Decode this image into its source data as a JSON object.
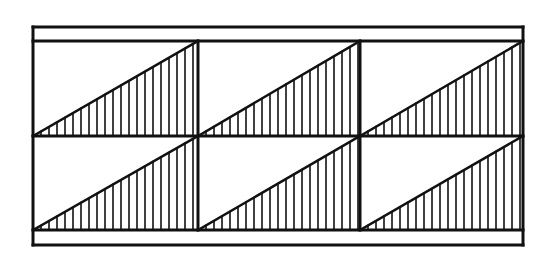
{
  "diagram": {
    "canvas": {
      "width": 555,
      "height": 258,
      "background": "#ffffff"
    },
    "stroke_color": "#111111",
    "frame": {
      "left": 33,
      "right": 523,
      "outer_top": 27,
      "inner_top": 41,
      "middle": 136,
      "inner_bottom": 230,
      "outer_bottom": 245,
      "stroke_width": 3
    },
    "columns": [
      33,
      198,
      360,
      523
    ],
    "rows": [
      {
        "top": 41,
        "bottom": 136
      },
      {
        "top": 136,
        "bottom": 230
      }
    ],
    "cells": [
      {
        "row": 0,
        "col": 0,
        "shape": "right-triangle",
        "hatch": "vertical"
      },
      {
        "row": 0,
        "col": 1,
        "shape": "right-triangle",
        "hatch": "vertical"
      },
      {
        "row": 0,
        "col": 2,
        "shape": "right-triangle",
        "hatch": "vertical"
      },
      {
        "row": 1,
        "col": 0,
        "shape": "right-triangle",
        "hatch": "vertical"
      },
      {
        "row": 1,
        "col": 1,
        "shape": "right-triangle",
        "hatch": "vertical"
      },
      {
        "row": 1,
        "col": 2,
        "shape": "right-triangle",
        "hatch": "vertical"
      }
    ],
    "hatch": {
      "spacing": 8,
      "stroke_width": 1.6,
      "lines_per_triangle": 20
    },
    "labels": []
  }
}
